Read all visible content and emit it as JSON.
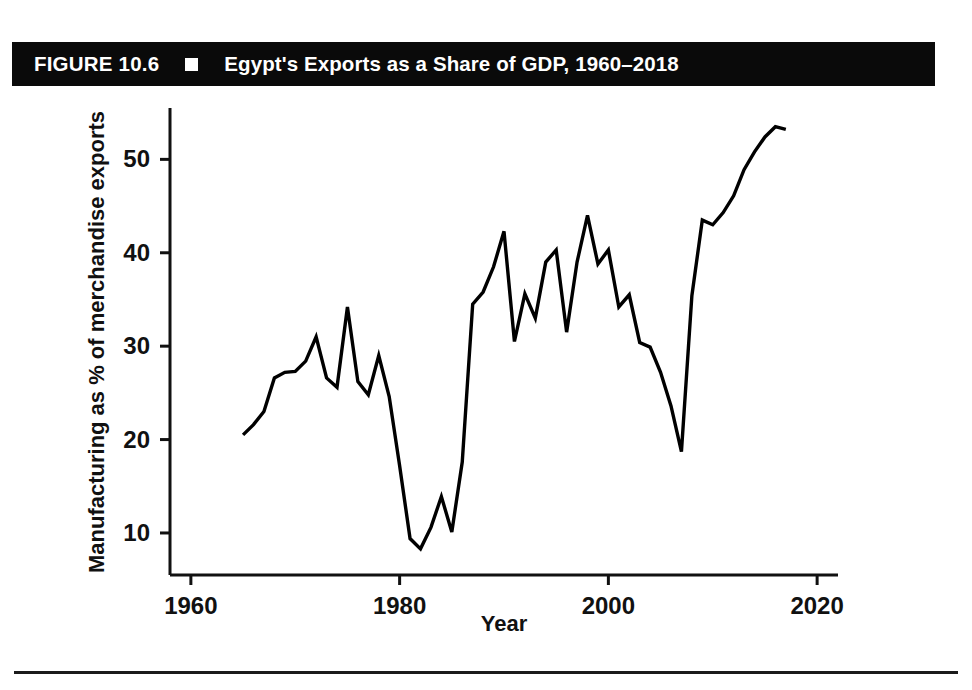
{
  "figure": {
    "label": "FIGURE 10.6",
    "marker": "filled-square-bullet",
    "title": "Egypt's Exports as a Share of GDP, 1960–2018"
  },
  "footer": {
    "source_note": ""
  },
  "chart_data": {
    "type": "line",
    "title": "Egypt's Exports as a Share of GDP, 1960–2018",
    "xlabel": "Year",
    "ylabel": "Manufacturing as % of merchandise exports",
    "xlim": [
      1958,
      2022
    ],
    "ylim": [
      5.5,
      55.5
    ],
    "xticks": [
      1960,
      1980,
      2000,
      2020
    ],
    "xtick_labels": [
      "1960",
      "1980",
      "2000",
      "2020"
    ],
    "yticks": [
      10,
      20,
      30,
      40,
      50
    ],
    "ytick_labels": [
      "10",
      "20",
      "30",
      "40",
      "50"
    ],
    "grid": false,
    "legend": false,
    "line_color": "#000000",
    "line_width": 3.4,
    "series": [
      {
        "name": "Manufacturing as % of merchandise exports",
        "x": [
          1965,
          1966,
          1967,
          1968,
          1969,
          1970,
          1971,
          1972,
          1973,
          1974,
          1975,
          1976,
          1977,
          1978,
          1979,
          1980,
          1981,
          1982,
          1983,
          1984,
          1985,
          1986,
          1987,
          1988,
          1989,
          1990,
          1991,
          1992,
          1993,
          1994,
          1995,
          1996,
          1997,
          1998,
          1999,
          2000,
          2001,
          2002,
          2003,
          2004,
          2005,
          2006,
          2007,
          2008,
          2009,
          2010,
          2011,
          2012,
          2013,
          2014,
          2015,
          2016,
          2017
        ],
        "y": [
          20.5,
          21.6,
          23.0,
          26.6,
          27.2,
          27.3,
          28.4,
          31.0,
          26.6,
          25.6,
          34.2,
          26.2,
          24.8,
          29.0,
          24.6,
          17.2,
          9.4,
          8.3,
          10.6,
          13.9,
          10.1,
          17.6,
          34.5,
          35.8,
          38.5,
          42.3,
          30.5,
          35.6,
          33.0,
          39.0,
          40.3,
          31.5,
          39.0,
          44.0,
          38.8,
          40.3,
          34.2,
          35.5,
          30.4,
          29.9,
          27.2,
          23.6,
          18.7,
          35.4,
          43.5,
          43.0,
          44.3,
          46.1,
          48.9,
          50.8,
          52.4,
          53.5,
          53.2
        ]
      }
    ]
  }
}
